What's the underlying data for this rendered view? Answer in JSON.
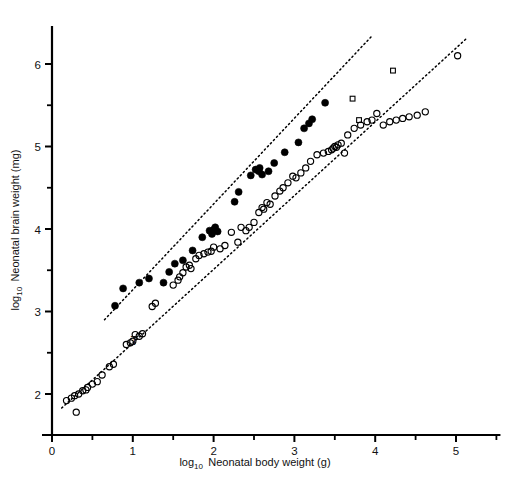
{
  "figure": {
    "background_color": "#ffffff",
    "foreground_color": "#000000"
  },
  "annotations": [
    {
      "label": "T",
      "x": 1.02,
      "y": 2.6
    }
  ],
  "chart_data": {
    "type": "scatter",
    "title": "",
    "xlabel_prefix": "log",
    "xlabel_sub": "10",
    "xlabel_rest": "Neonatal body weight (g)",
    "xlabel": "log10 Neonatal body weight (g)",
    "ylabel_prefix": "log",
    "ylabel_sub": "10",
    "ylabel_rest": "Neonatal brain weight (mg)",
    "ylabel": "log10 Neonatal brain weight (mg)",
    "xlim": [
      -0.15,
      5.55
    ],
    "ylim": [
      1.55,
      6.52
    ],
    "xticks": [
      0,
      1,
      2,
      3,
      4,
      5
    ],
    "xtick_labels": [
      "0",
      "1",
      "2",
      "3",
      "4",
      "5"
    ],
    "xminor_ticks": [
      0.5,
      1.5,
      2.5,
      3.5,
      4.5,
      5.5
    ],
    "yticks": [
      2,
      3,
      4,
      5,
      6
    ],
    "ytick_labels": [
      "2",
      "3",
      "4",
      "5",
      "6"
    ],
    "yminor_ticks": [
      2.5,
      3.5,
      4.5,
      5.5,
      6.5
    ],
    "grid": false,
    "legend_position": "none",
    "series": [
      {
        "name": "filled-circles",
        "marker": "filled-circle",
        "color": "#000000",
        "marker_size": 5.2,
        "points": [
          [
            0.78,
            3.07
          ],
          [
            0.88,
            3.28
          ],
          [
            1.08,
            3.35
          ],
          [
            1.2,
            3.4
          ],
          [
            1.38,
            3.35
          ],
          [
            1.45,
            3.48
          ],
          [
            1.52,
            3.58
          ],
          [
            1.62,
            3.62
          ],
          [
            1.74,
            3.74
          ],
          [
            1.86,
            3.9
          ],
          [
            1.95,
            3.98
          ],
          [
            1.98,
            3.94
          ],
          [
            2.0,
            3.99
          ],
          [
            2.02,
            4.02
          ],
          [
            2.05,
            3.97
          ],
          [
            2.26,
            4.33
          ],
          [
            2.31,
            4.45
          ],
          [
            2.46,
            4.65
          ],
          [
            2.52,
            4.72
          ],
          [
            2.56,
            4.7
          ],
          [
            2.57,
            4.74
          ],
          [
            2.6,
            4.66
          ],
          [
            2.68,
            4.7
          ],
          [
            2.75,
            4.8
          ],
          [
            2.88,
            4.93
          ],
          [
            3.05,
            5.05
          ],
          [
            3.12,
            5.22
          ],
          [
            3.18,
            5.28
          ],
          [
            3.22,
            5.33
          ],
          [
            3.38,
            5.53
          ]
        ]
      },
      {
        "name": "open-circles",
        "marker": "open-circle",
        "color": "#000000",
        "marker_size": 5.0,
        "points": [
          [
            0.18,
            1.92
          ],
          [
            0.24,
            1.95
          ],
          [
            0.28,
            1.98
          ],
          [
            0.3,
            1.78
          ],
          [
            0.33,
            2.0
          ],
          [
            0.38,
            2.04
          ],
          [
            0.42,
            2.05
          ],
          [
            0.44,
            2.08
          ],
          [
            0.5,
            2.12
          ],
          [
            0.56,
            2.15
          ],
          [
            0.62,
            2.23
          ],
          [
            0.71,
            2.33
          ],
          [
            0.76,
            2.36
          ],
          [
            0.92,
            2.6
          ],
          [
            0.97,
            2.62
          ],
          [
            1.0,
            2.64
          ],
          [
            1.03,
            2.72
          ],
          [
            1.08,
            2.7
          ],
          [
            1.12,
            2.73
          ],
          [
            1.24,
            3.06
          ],
          [
            1.28,
            3.1
          ],
          [
            1.5,
            3.32
          ],
          [
            1.56,
            3.38
          ],
          [
            1.58,
            3.42
          ],
          [
            1.62,
            3.47
          ],
          [
            1.66,
            3.54
          ],
          [
            1.7,
            3.56
          ],
          [
            1.72,
            3.52
          ],
          [
            1.78,
            3.64
          ],
          [
            1.82,
            3.68
          ],
          [
            1.88,
            3.7
          ],
          [
            1.93,
            3.72
          ],
          [
            1.97,
            3.73
          ],
          [
            2.0,
            3.78
          ],
          [
            2.08,
            3.76
          ],
          [
            2.14,
            3.8
          ],
          [
            2.22,
            3.96
          ],
          [
            2.3,
            3.84
          ],
          [
            2.34,
            4.02
          ],
          [
            2.4,
            3.98
          ],
          [
            2.44,
            4.02
          ],
          [
            2.5,
            4.08
          ],
          [
            2.56,
            4.2
          ],
          [
            2.6,
            4.26
          ],
          [
            2.62,
            4.24
          ],
          [
            2.66,
            4.32
          ],
          [
            2.7,
            4.3
          ],
          [
            2.76,
            4.4
          ],
          [
            2.82,
            4.46
          ],
          [
            2.86,
            4.5
          ],
          [
            2.92,
            4.56
          ],
          [
            2.98,
            4.64
          ],
          [
            3.02,
            4.62
          ],
          [
            3.08,
            4.68
          ],
          [
            3.14,
            4.74
          ],
          [
            3.2,
            4.82
          ],
          [
            3.28,
            4.9
          ],
          [
            3.36,
            4.92
          ],
          [
            3.42,
            4.94
          ],
          [
            3.46,
            4.96
          ],
          [
            3.48,
            4.98
          ],
          [
            3.5,
            5.0
          ],
          [
            3.52,
            4.99
          ],
          [
            3.54,
            5.02
          ],
          [
            3.58,
            5.04
          ],
          [
            3.62,
            4.92
          ],
          [
            3.66,
            5.14
          ],
          [
            3.74,
            5.22
          ],
          [
            3.82,
            5.26
          ],
          [
            3.9,
            5.3
          ],
          [
            3.96,
            5.32
          ],
          [
            4.02,
            5.4
          ],
          [
            4.1,
            5.26
          ],
          [
            4.18,
            5.3
          ],
          [
            4.26,
            5.32
          ],
          [
            4.34,
            5.34
          ],
          [
            4.42,
            5.36
          ],
          [
            4.52,
            5.38
          ],
          [
            4.62,
            5.42
          ],
          [
            5.02,
            6.1
          ]
        ]
      },
      {
        "name": "open-squares",
        "marker": "open-square",
        "color": "#000000",
        "marker_size": 4.8,
        "points": [
          [
            4.22,
            5.92
          ],
          [
            3.72,
            5.58
          ],
          [
            3.8,
            5.32
          ]
        ]
      }
    ],
    "trend_lines": [
      {
        "name": "upper-regression-line",
        "style": "dotted",
        "color": "#000000",
        "x_start": 0.65,
        "y_start": 2.9,
        "x_end": 3.95,
        "y_end": 6.33
      },
      {
        "name": "lower-regression-line",
        "style": "dotted",
        "color": "#000000",
        "x_start": 0.12,
        "y_start": 1.83,
        "x_end": 5.12,
        "y_end": 6.3
      }
    ]
  }
}
